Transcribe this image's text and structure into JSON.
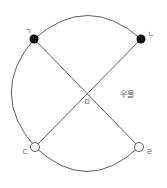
{
  "diagram": {
    "nodes": [
      {
        "id": "giyeok",
        "label": "ㄱ",
        "x": 34,
        "y": 39,
        "fill": "filled"
      },
      {
        "id": "nieun",
        "label": "ㄴ",
        "x": 141,
        "y": 39,
        "fill": "filled"
      },
      {
        "id": "digeut",
        "label": "ㄷ",
        "x": 35,
        "y": 147,
        "fill": "open"
      },
      {
        "id": "rieul",
        "label": "ㄹ",
        "x": 139,
        "y": 147,
        "fill": "open"
      }
    ],
    "center": {
      "label": "ㅁ",
      "x": 87,
      "y": 94
    },
    "annotation": "우물",
    "colors": {
      "line": "#333333",
      "node_fill": "#111111",
      "open_fill": "#ffffff"
    }
  }
}
